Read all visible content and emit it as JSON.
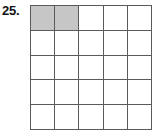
{
  "problem": {
    "number_label": "25."
  },
  "figure": {
    "type": "grid",
    "rows": 5,
    "columns": 5,
    "cell_fill_default": "#ffffff",
    "cell_fill_shaded": "#c6c6c6",
    "grid_line_color": "#5a5a5a",
    "shaded_cell_count": 2,
    "total_cell_count": 25,
    "cells": [
      [
        "shaded",
        "shaded",
        "empty",
        "empty",
        "empty"
      ],
      [
        "empty",
        "empty",
        "empty",
        "empty",
        "empty"
      ],
      [
        "empty",
        "empty",
        "empty",
        "empty",
        "empty"
      ],
      [
        "empty",
        "empty",
        "empty",
        "empty",
        "empty"
      ],
      [
        "empty",
        "empty",
        "empty",
        "empty",
        "empty"
      ]
    ]
  }
}
